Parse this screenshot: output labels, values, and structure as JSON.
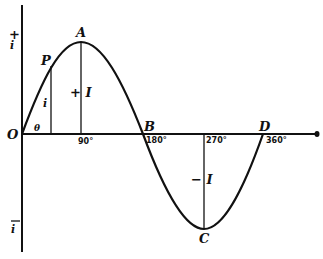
{
  "diagram": {
    "points": {
      "origin": "O",
      "peak": "A",
      "zero_cross": "B",
      "trough": "C",
      "end": "D",
      "instant": "P"
    },
    "axis_labels": {
      "pos_i": "+",
      "pos_i_sym": "i",
      "neg_i_bar": "i",
      "theta": "θ"
    },
    "ticks": [
      "90°",
      "180°",
      "270°",
      "360°"
    ],
    "amplitudes": {
      "pos": "+ I",
      "neg": "− I",
      "instant": "i"
    }
  }
}
